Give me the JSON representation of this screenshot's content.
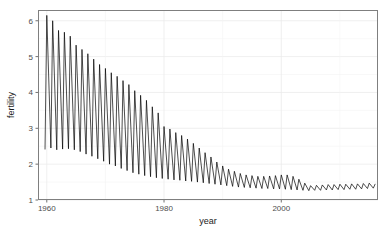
{
  "chart_data": {
    "type": "line",
    "title": "",
    "subtitle": "",
    "xlabel": "year",
    "ylabel": "fertility",
    "xlim": [
      1958.5,
      2016.5
    ],
    "ylim": [
      1.0,
      6.3
    ],
    "xticks": [
      1960,
      1980,
      2000
    ],
    "xtick_labels": [
      "1960",
      "1980",
      "2000"
    ],
    "yticks": [
      1,
      2,
      3,
      4,
      5,
      6
    ],
    "ytick_labels": [
      "1",
      "2",
      "3",
      "4",
      "5",
      "6"
    ],
    "grid": true,
    "grid_color": "#ebebeb",
    "line_color": "#000000",
    "line_width": 0.7,
    "panel_background": "#ffffff",
    "panel_border_color": "#7f7f7f",
    "legend": "none",
    "series": [
      {
        "name": "fertility",
        "description": "Sawtooth oscillating series: each year rises sharply to a peak then falls to a trough; overall declining envelope.",
        "x": [
          1959.7,
          1960.0,
          1960.7,
          1961.0,
          1961.7,
          1962.0,
          1962.7,
          1963.0,
          1963.7,
          1964.0,
          1964.7,
          1965.0,
          1965.7,
          1966.0,
          1966.7,
          1967.0,
          1967.7,
          1968.0,
          1968.7,
          1969.0,
          1969.7,
          1970.0,
          1970.7,
          1971.0,
          1971.7,
          1972.0,
          1972.7,
          1973.0,
          1973.7,
          1974.0,
          1974.7,
          1975.0,
          1975.7,
          1976.0,
          1976.7,
          1977.0,
          1977.7,
          1978.0,
          1978.7,
          1979.0,
          1979.7,
          1980.0,
          1980.7,
          1981.0,
          1981.7,
          1982.0,
          1982.7,
          1983.0,
          1983.7,
          1984.0,
          1984.7,
          1985.0,
          1985.7,
          1986.0,
          1986.7,
          1987.0,
          1987.7,
          1988.0,
          1988.7,
          1989.0,
          1989.7,
          1990.0,
          1990.7,
          1991.0,
          1991.7,
          1992.0,
          1992.7,
          1993.0,
          1993.7,
          1994.0,
          1994.7,
          1995.0,
          1995.7,
          1996.0,
          1996.7,
          1997.0,
          1997.7,
          1998.0,
          1998.7,
          1999.0,
          1999.7,
          2000.0,
          2000.7,
          2001.0,
          2001.7,
          2002.0,
          2002.7,
          2003.0,
          2003.7,
          2004.0,
          2004.7,
          2005.0,
          2005.7,
          2006.0,
          2006.7,
          2007.0,
          2007.7,
          2008.0,
          2008.7,
          2009.0,
          2009.7,
          2010.0,
          2010.7,
          2011.0,
          2011.7,
          2012.0,
          2012.7,
          2013.0,
          2013.7,
          2014.0,
          2014.7,
          2015.0,
          2015.7,
          2016.0
        ],
        "y": [
          2.42,
          6.15,
          2.45,
          6.0,
          2.4,
          5.73,
          2.42,
          5.68,
          2.43,
          5.57,
          2.4,
          5.32,
          2.35,
          5.2,
          2.28,
          5.08,
          2.22,
          4.93,
          2.15,
          4.78,
          2.08,
          4.67,
          2.0,
          4.55,
          1.95,
          4.45,
          1.88,
          4.33,
          1.82,
          4.22,
          1.76,
          4.05,
          1.72,
          3.92,
          1.68,
          3.78,
          1.65,
          3.6,
          1.62,
          3.43,
          1.6,
          3.05,
          1.58,
          2.98,
          1.56,
          2.88,
          1.55,
          2.8,
          1.53,
          2.7,
          1.52,
          2.58,
          1.5,
          2.45,
          1.48,
          2.32,
          1.46,
          2.2,
          1.44,
          2.06,
          1.42,
          1.95,
          1.4,
          1.86,
          1.38,
          1.8,
          1.36,
          1.74,
          1.35,
          1.7,
          1.34,
          1.68,
          1.33,
          1.66,
          1.32,
          1.66,
          1.32,
          1.67,
          1.31,
          1.68,
          1.31,
          1.7,
          1.3,
          1.7,
          1.29,
          1.66,
          1.28,
          1.58,
          1.27,
          1.47,
          1.26,
          1.4,
          1.27,
          1.41,
          1.27,
          1.42,
          1.28,
          1.43,
          1.28,
          1.43,
          1.29,
          1.44,
          1.29,
          1.44,
          1.3,
          1.45,
          1.3,
          1.45,
          1.31,
          1.46,
          1.32,
          1.47,
          1.33,
          1.44
        ]
      }
    ]
  }
}
